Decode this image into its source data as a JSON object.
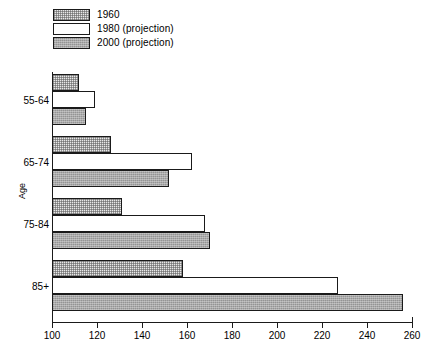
{
  "chart_data": {
    "type": "bar",
    "orientation": "horizontal",
    "title": "",
    "xlabel": "",
    "ylabel": "Age",
    "categories": [
      "55-64",
      "65-74",
      "75-84",
      "85+"
    ],
    "series": [
      {
        "name": "1960",
        "values": [
          112,
          126,
          131,
          158
        ]
      },
      {
        "name": "1980 (projection)",
        "values": [
          119,
          162,
          168,
          227
        ]
      },
      {
        "name": "2000 (projection)",
        "values": [
          115,
          152,
          170,
          256
        ]
      }
    ],
    "xlim": [
      100,
      260
    ],
    "xticks": [
      100,
      120,
      140,
      160,
      180,
      200,
      220,
      240,
      260
    ],
    "grid": false,
    "legend_position": "top-left"
  },
  "legend": {
    "items": [
      {
        "label": "1960",
        "swatch": "light-stipple"
      },
      {
        "label": "1980 (projection)",
        "swatch": "white"
      },
      {
        "label": "2000 (projection)",
        "swatch": "dark-stipple"
      }
    ]
  },
  "axes": {
    "y_title": "Age",
    "x_tick_labels": [
      "100",
      "120",
      "140",
      "160",
      "180",
      "200",
      "220",
      "240",
      "260"
    ],
    "y_tick_labels": [
      "55-64",
      "65-74",
      "75-84",
      "85+"
    ]
  },
  "colors": {
    "axis": "#1a1a1a",
    "series_1960": "#e8e8e8",
    "series_1980": "#ffffff",
    "series_2000": "#a9a9a9",
    "background": "#ffffff"
  }
}
